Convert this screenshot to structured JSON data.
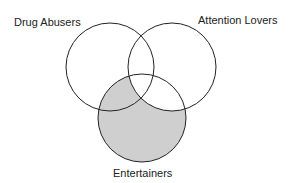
{
  "diagram": {
    "type": "venn",
    "sets": [
      {
        "label": "Drug Abusers",
        "cx": 110,
        "cy": 67,
        "r": 44
      },
      {
        "label": "Attention Lovers",
        "cx": 172,
        "cy": 67,
        "r": 44
      },
      {
        "label": "Entertainers",
        "cx": 142,
        "cy": 118,
        "r": 44
      }
    ],
    "shaded_region": "Entertainers minus Attention Lovers",
    "shade_color": "#cfcfcf",
    "stroke_color": "#222222"
  }
}
